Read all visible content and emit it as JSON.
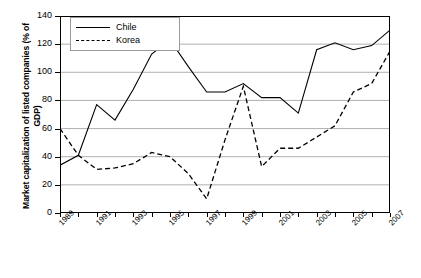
{
  "chart_data": {
    "type": "line",
    "title": "",
    "xlabel": "",
    "ylabel": "Market capitalization of listed companies (% of GDP)",
    "x": [
      1989,
      1990,
      1991,
      1992,
      1993,
      1994,
      1995,
      1996,
      1997,
      1998,
      1999,
      2000,
      2001,
      2002,
      2003,
      2004,
      2005,
      2006,
      2007
    ],
    "xtick_labels": [
      "1989",
      "1991",
      "1993",
      "1995",
      "1997",
      "1999",
      "2001",
      "2003",
      "2005",
      "2007"
    ],
    "xtick_values": [
      1989,
      1991,
      1993,
      1995,
      1997,
      1999,
      2001,
      2003,
      2005,
      2007
    ],
    "xlim": [
      1989,
      2007
    ],
    "ylim": [
      0,
      140
    ],
    "ytick_labels": [
      "0",
      "20",
      "40",
      "60",
      "80",
      "100",
      "120",
      "140"
    ],
    "ytick_values": [
      0,
      20,
      40,
      60,
      80,
      100,
      120,
      140
    ],
    "grid": true,
    "grid_axis": "y",
    "legend_position": "upper-left",
    "series": [
      {
        "name": "Chile",
        "style": "solid",
        "color": "#000000",
        "values": [
          34,
          41,
          77,
          66,
          88,
          113,
          123,
          104,
          86,
          86,
          92,
          82,
          82,
          71,
          116,
          121,
          116,
          119,
          130
        ]
      },
      {
        "name": "Korea",
        "style": "dashed",
        "color": "#000000",
        "values": [
          60,
          41,
          31,
          32,
          35,
          43,
          40,
          28,
          10,
          52,
          90,
          33,
          46,
          46,
          54,
          62,
          86,
          92,
          115
        ]
      }
    ]
  }
}
